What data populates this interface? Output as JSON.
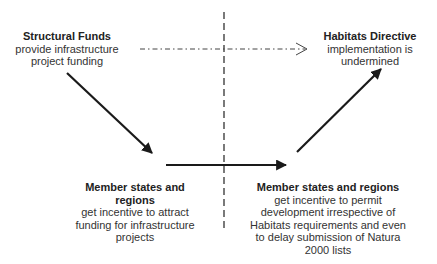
{
  "diagram": {
    "nodes": [
      {
        "id": "funds",
        "title": "Structural Funds",
        "desc": "provide infrastructure project funding"
      },
      {
        "id": "habitats",
        "title": "Habitats Directive",
        "desc": "implementation is undermined"
      },
      {
        "id": "member_left",
        "title": "Member states and regions",
        "desc": "get incentive to attract funding for infrastructure projects"
      },
      {
        "id": "member_right",
        "title": "Member states and regions",
        "desc": "get incentive to permit development irrespective of Habitats requirements and even to delay submission of Natura 2000 lists"
      }
    ],
    "edges": [
      {
        "from": "funds",
        "to": "member_left",
        "style": "solid",
        "arrow": "filled"
      },
      {
        "from": "member_left",
        "to": "member_right",
        "style": "solid",
        "arrow": "filled"
      },
      {
        "from": "member_right",
        "to": "habitats",
        "style": "solid",
        "arrow": "filled"
      },
      {
        "from": "funds",
        "to": "habitats",
        "style": "dash-dot",
        "arrow": "open"
      }
    ],
    "divider": {
      "style": "dashed",
      "orientation": "vertical"
    }
  }
}
